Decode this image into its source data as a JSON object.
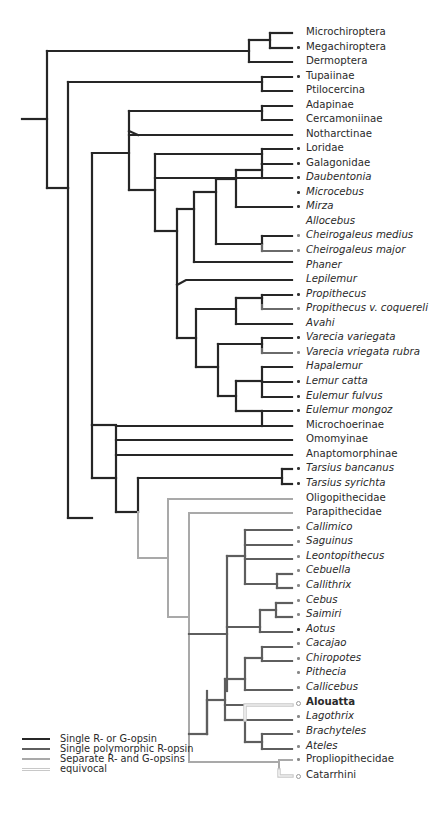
{
  "figure": {
    "type": "phylogenetic-tree"
  },
  "colors": {
    "single_r_or_g": "#262626",
    "single_polymorphic_r": "#5e5e5e",
    "separate_r_and_g": "#a9a9a9",
    "equivocal": "#cfcfcf"
  },
  "legend": [
    {
      "label": "Single R- or G-opsin",
      "state": "single_r_or_g"
    },
    {
      "label": "Single polymorphic R-opsin",
      "state": "single_polymorphic_r"
    },
    {
      "label": "Separate R- and G-opsins",
      "state": "separate_r_and_g"
    },
    {
      "label": "equivocal",
      "state": "equivocal"
    }
  ],
  "leaves": [
    {
      "label": "Microchiroptera",
      "style": "normal",
      "marker": "none",
      "state": "single_r_or_g"
    },
    {
      "label": "Megachiroptera",
      "style": "normal",
      "marker": "dot",
      "state": "single_r_or_g"
    },
    {
      "label": "Dermoptera",
      "style": "normal",
      "marker": "none",
      "state": "single_r_or_g"
    },
    {
      "label": "Tupaiinae",
      "style": "normal",
      "marker": "dot",
      "state": "single_r_or_g"
    },
    {
      "label": "Ptilocercina",
      "style": "normal",
      "marker": "none",
      "state": "single_r_or_g"
    },
    {
      "label": "Adapinae",
      "style": "normal",
      "marker": "none",
      "state": "single_r_or_g"
    },
    {
      "label": "Cercamoniinae",
      "style": "normal",
      "marker": "none",
      "state": "single_r_or_g"
    },
    {
      "label": "Notharctinae",
      "style": "normal",
      "marker": "none",
      "state": "single_r_or_g"
    },
    {
      "label": "Loridae",
      "style": "normal",
      "marker": "dot",
      "state": "single_r_or_g"
    },
    {
      "label": "Galagonidae",
      "style": "normal",
      "marker": "dot",
      "state": "single_r_or_g"
    },
    {
      "label": "Daubentonia",
      "style": "italic",
      "marker": "dot",
      "state": "single_r_or_g"
    },
    {
      "label": "Microcebus",
      "style": "italic",
      "marker": "dot",
      "state": "single_r_or_g"
    },
    {
      "label": "Mirza",
      "style": "italic",
      "marker": "dot",
      "state": "single_r_or_g"
    },
    {
      "label": "Allocebus",
      "style": "italic",
      "marker": "none",
      "state": "single_r_or_g"
    },
    {
      "label": "Cheirogaleus medius",
      "style": "italic",
      "marker": "dot-grey",
      "state": "single_r_or_g"
    },
    {
      "label": "Cheirogaleus major",
      "style": "italic",
      "marker": "dot-grey",
      "state": "single_polymorphic_r"
    },
    {
      "label": "Phaner",
      "style": "italic",
      "marker": "none",
      "state": "single_r_or_g"
    },
    {
      "label": "Lepilemur",
      "style": "italic",
      "marker": "none",
      "state": "single_r_or_g"
    },
    {
      "label": "Propithecus",
      "style": "italic",
      "marker": "dot",
      "state": "single_r_or_g"
    },
    {
      "label": "Propithecus v. coquereli",
      "style": "italic",
      "marker": "dot-grey",
      "state": "single_polymorphic_r"
    },
    {
      "label": "Avahi",
      "style": "italic",
      "marker": "none",
      "state": "single_r_or_g"
    },
    {
      "label": "Varecia variegata",
      "style": "italic",
      "marker": "dot",
      "state": "single_r_or_g"
    },
    {
      "label": "Varecia vriegata rubra",
      "style": "italic",
      "marker": "dot-grey",
      "state": "single_polymorphic_r"
    },
    {
      "label": "Hapalemur",
      "style": "italic",
      "marker": "none",
      "state": "single_r_or_g"
    },
    {
      "label": "Lemur catta",
      "style": "italic",
      "marker": "dot",
      "state": "single_r_or_g"
    },
    {
      "label": "Eulemur fulvus",
      "style": "italic",
      "marker": "dot",
      "state": "single_r_or_g"
    },
    {
      "label": "Eulemur mongoz",
      "style": "italic",
      "marker": "dot",
      "state": "single_r_or_g"
    },
    {
      "label": "Microchoerinae",
      "style": "normal",
      "marker": "none",
      "state": "single_r_or_g"
    },
    {
      "label": "Omomyinae",
      "style": "normal",
      "marker": "none",
      "state": "single_r_or_g"
    },
    {
      "label": "Anaptomorphinae",
      "style": "normal",
      "marker": "none",
      "state": "single_r_or_g"
    },
    {
      "label": "Tarsius bancanus",
      "style": "italic",
      "marker": "dot",
      "state": "single_r_or_g"
    },
    {
      "label": "Tarsius syrichta",
      "style": "italic",
      "marker": "dot",
      "state": "single_r_or_g"
    },
    {
      "label": "Oligopithecidae",
      "style": "normal",
      "marker": "none",
      "state": "separate_r_and_g"
    },
    {
      "label": "Parapithecidae",
      "style": "normal",
      "marker": "none",
      "state": "separate_r_and_g"
    },
    {
      "label": "Callimico",
      "style": "italic",
      "marker": "dot-grey",
      "state": "single_polymorphic_r"
    },
    {
      "label": "Saguinus",
      "style": "italic",
      "marker": "dot-grey",
      "state": "single_polymorphic_r"
    },
    {
      "label": "Leontopithecus",
      "style": "italic",
      "marker": "dot-grey",
      "state": "single_polymorphic_r"
    },
    {
      "label": "Cebuella",
      "style": "italic",
      "marker": "dot-grey",
      "state": "single_polymorphic_r"
    },
    {
      "label": "Callithrix",
      "style": "italic",
      "marker": "dot-grey",
      "state": "single_polymorphic_r"
    },
    {
      "label": "Cebus",
      "style": "italic",
      "marker": "dot-grey",
      "state": "single_polymorphic_r"
    },
    {
      "label": "Saimiri",
      "style": "italic",
      "marker": "dot-grey",
      "state": "single_polymorphic_r"
    },
    {
      "label": "Aotus",
      "style": "italic",
      "marker": "dot",
      "state": "single_r_or_g"
    },
    {
      "label": "Cacajao",
      "style": "italic",
      "marker": "dot-grey",
      "state": "single_polymorphic_r"
    },
    {
      "label": "Chiropotes",
      "style": "italic",
      "marker": "dot-grey",
      "state": "single_polymorphic_r"
    },
    {
      "label": "Pithecia",
      "style": "italic",
      "marker": "dot-grey",
      "state": "single_polymorphic_r"
    },
    {
      "label": "Callicebus",
      "style": "italic",
      "marker": "dot-grey",
      "state": "single_polymorphic_r"
    },
    {
      "label": "Alouatta",
      "style": "bold",
      "marker": "open",
      "state": "equivocal"
    },
    {
      "label": "Lagothrix",
      "style": "italic",
      "marker": "dot-grey",
      "state": "single_polymorphic_r"
    },
    {
      "label": "Brachyteles",
      "style": "italic",
      "marker": "dot-grey",
      "state": "single_polymorphic_r"
    },
    {
      "label": "Ateles",
      "style": "italic",
      "marker": "dot-grey",
      "state": "single_polymorphic_r"
    },
    {
      "label": "Propliopithecidae",
      "style": "normal",
      "marker": "dot-grey",
      "state": "separate_r_and_g"
    },
    {
      "label": "Catarrhini",
      "style": "normal",
      "marker": "open",
      "state": "equivocal"
    }
  ],
  "layout": {
    "leaf_y0": 33,
    "leaf_dy": 14.55,
    "leaf_x": 302
  },
  "edges": [
    {
      "d": "M22,119 H47 M47,51 V188 M47,51 H249 M47,188 H68",
      "state": "single_r_or_g"
    },
    {
      "d": "M249,51 V33 H270 M249,51 V62 H270 M270,33 V48 M270,62 H270 M270,33 H292 M270,48 H292 M249,62 H292",
      "state": "single_r_or_g"
    },
    {
      "d": "M68,188 V82 H262 M262,77 V91 M262,77 H292 M262,91 H292",
      "state": "single_r_or_g"
    },
    {
      "d": "M68,188 V518 H92 M92,153 V490 M92,153 H129 M129,111 V190 M129,111 H262 M262,106 V120 M262,106 H292 M262,120 H292",
      "state": "single_r_or_g"
    },
    {
      "d": "M129,131 L138,131 H292",
      "state": "single_r_or_g"
    },
    {
      "d": "M129,190 H155 M155,154 V231 M155,154 H262 M262,149 V164 M262,149 H292 M262,164 H292",
      "state": "single_r_or_g"
    },
    {
      "d": "M155,175 H292",
      "state": "single_r_or_g"
    },
    {
      "d": "M155,231 H177 M177,209 V338 M177,209 H194 M194,189 V262 M194,189 H216 M216,176 V233 M216,176 H236 M236,172 V201 M236,172 H262 M262,164 V186 M262,166 H292 M262,186 H292 M236,201 H292 M216,233 H262 M262,226 V247 M262,226 H292 M194,262 H292",
      "state": "single_r_or_g"
    },
    {
      "d": "M262,240 H292 M262,295 H292 M262,368 H292",
      "state": "single_polymorphic_r"
    },
    {
      "d": "M177,289 L186,276 H292",
      "state": "single_r_or_g"
    },
    {
      "d": "M177,338 H196 M196,313 V367 M196,313 H236 M236,299 V329 M236,299 H262 M262,284 V299 M262,284 H292 M236,329 H292",
      "state": "single_r_or_g"
    },
    {
      "d": "M196,367 H218 M218,345 V398 M218,345 H262 M262,343 V357 M262,343 H292",
      "state": "single_r_or_g"
    },
    {
      "d": "M218,398 H236 M236,386 V414 M236,386 H262 M262,372 V400 M262,372 H292 M262,400 H292 M236,414 H262 M262,414 V443 M262,414 H292 M262,443 H292",
      "state": "single_r_or_g"
    },
    {
      "d": "M92,440 H292 M92,453 H292 M92,473 H292 M92,473 V486 M92,486 V490",
      "state": "single_r_or_g"
    },
    {
      "d": "M68,518 H116 M116,491 V518 M116,491 H292 M292,490 V512 M292,490 H298 M292,512 H298",
      "state": "single_r_or_g"
    },
    {
      "d": "M116,518 V558 H147 M147,498 V617 M147,498 H292 M147,617 H160 M160,513 V730",
      "state": "separate_r_and_g"
    },
    {
      "d": "M160,513 H292",
      "state": "separate_r_and_g"
    },
    {
      "d": "M160,730 H205 M205,776 H197 M205,768 V777",
      "state": "separate_r_and_g"
    },
    {
      "d": "M160,730 V752 H220",
      "state": "separate_r_and_g"
    },
    {
      "d": "M220,752 V768 M220,758 H285 M285,759 V776",
      "state": "separate_r_and_g"
    }
  ]
}
